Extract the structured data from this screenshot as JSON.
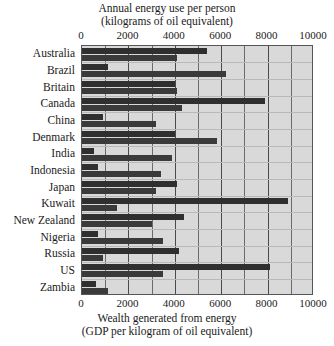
{
  "chart_data": {
    "type": "bar",
    "orientation": "horizontal",
    "title": "Annual energy use per person",
    "title_line2": "(kilograms of oil equivalent)",
    "footer_line1": "Wealth generated from energy",
    "footer_line2": "(GDP per kilogram of oil equivalent)",
    "xlabel": "",
    "ylabel": "",
    "xlim": [
      0,
      10000
    ],
    "tick_labels": [
      "0",
      "2000",
      "4000",
      "6000",
      "8000",
      "10000"
    ],
    "tick_values": [
      0,
      2000,
      4000,
      6000,
      8000,
      10000
    ],
    "gridline_step": 1000,
    "grid": true,
    "legend": "none",
    "categories": [
      "Australia",
      "Brazil",
      "Britain",
      "Canada",
      "China",
      "Denmark",
      "India",
      "Indonesia",
      "Japan",
      "Kuwait",
      "New Zealand",
      "Nigeria",
      "Russia",
      "US",
      "Zambia"
    ],
    "series": [
      {
        "name": "Annual energy use per person",
        "axis": "top",
        "color": "#2f2f2f",
        "values": [
          5400,
          1100,
          4000,
          7900,
          900,
          4000,
          500,
          700,
          4100,
          8900,
          4400,
          700,
          4200,
          8100,
          600
        ]
      },
      {
        "name": "Wealth generated from energy",
        "axis": "bottom",
        "color": "#3a3a3a",
        "values": [
          4100,
          6200,
          4100,
          4300,
          3200,
          5800,
          3900,
          3400,
          3200,
          1500,
          3000,
          3500,
          900,
          3500,
          1100
        ]
      }
    ]
  },
  "colors": {
    "plot_background": "#d9d9d9",
    "bar_dark": "#2f2f2f",
    "gridline": "#6b6b6b",
    "border": "#555555",
    "text": "#1a1a1a"
  }
}
